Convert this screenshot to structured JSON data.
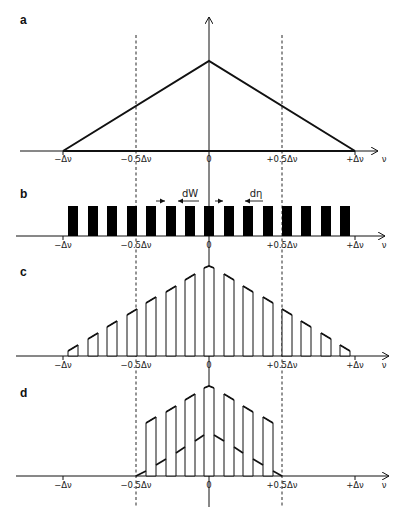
{
  "figure": {
    "panels": [
      {
        "id": "a",
        "label": "a",
        "description": "Triangular line shape from -Δν to +Δν with peak at 0"
      },
      {
        "id": "b",
        "label": "b",
        "description": "Comb of 15 rectangular bars (slit/grating) with width dW and spacing dη",
        "annotations": {
          "width": "dW",
          "spacing": "dη"
        }
      },
      {
        "id": "c",
        "label": "c",
        "description": "Triangle profile sampled by the 15 bars"
      },
      {
        "id": "d",
        "label": "d",
        "description": "Sampled profile restricted to -0.5Δν..+0.5Δν with lower folded triangle"
      }
    ],
    "axis": {
      "variable": "ν",
      "ticks": [
        "−Δν",
        "−0.5Δν",
        "0",
        "+0.5Δν",
        "+Δν"
      ],
      "tick_values": [
        -1,
        -0.5,
        0,
        0.5,
        1
      ]
    },
    "bars": {
      "count": 15,
      "centers": [
        -0.93,
        -0.8,
        -0.66,
        -0.53,
        -0.4,
        -0.27,
        -0.13,
        0,
        0.13,
        0.27,
        0.4,
        0.53,
        0.66,
        0.8,
        0.93
      ]
    }
  }
}
